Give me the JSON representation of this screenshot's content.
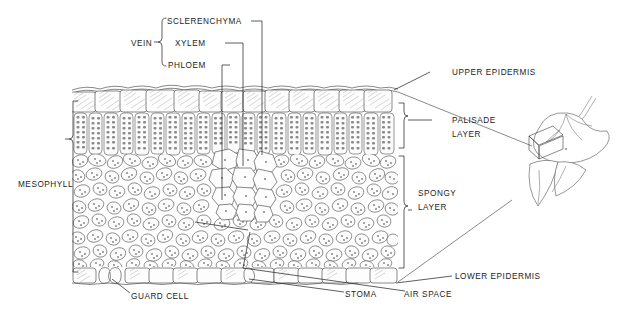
{
  "figure": {
    "background_color": "#ffffff",
    "ink_color": "#1c1c1c"
  },
  "labels": {
    "vein": "VEIN",
    "sclerenchyma": "SCLERENCHYMA",
    "xylem": "XYLEM",
    "phloem": "PHLOEM",
    "upper_epidermis": "UPPER  EPIDERMIS",
    "palisade_layer_line1": "PALISADE",
    "palisade_layer_line2": "LAYER",
    "spongy_layer_line1": "SPONGY",
    "spongy_layer_line2": "LAYER",
    "mesophyll": "MESOPHYLL",
    "lower_epidermis": "LOWER  EPIDERMIS",
    "guard_cell": "GUARD  CELL",
    "stoma": "STOMA",
    "air_space": "AIR  SPACE"
  },
  "structures": {
    "tissue_block": {
      "left": 72,
      "right": 398,
      "top": 86,
      "bottom": 282
    },
    "layers": [
      {
        "name": "cuticle",
        "top": 86,
        "bottom": 90
      },
      {
        "name": "upper-epidermis",
        "top": 90,
        "bottom": 112
      },
      {
        "name": "palisade-layer",
        "top": 112,
        "bottom": 155
      },
      {
        "name": "spongy-layer",
        "top": 155,
        "bottom": 265
      },
      {
        "name": "lower-epidermis",
        "top": 265,
        "bottom": 282
      }
    ],
    "vascular_bundle": {
      "center_x": 243,
      "top": 150,
      "bottom": 215
    }
  },
  "brackets": {
    "mesophyll": {
      "x": 74,
      "top": 101,
      "bottom": 272
    },
    "palisade": {
      "x": 404,
      "top": 103,
      "bottom": 152
    },
    "spongy": {
      "x": 404,
      "top": 156,
      "bottom": 268
    },
    "vein": {
      "x": 166,
      "top": 20,
      "bottom": 64
    }
  },
  "leaf_inset": {
    "name": "whole-leaf-illustration",
    "center_x": 556,
    "center_y": 158,
    "sample_box": {
      "x": 529,
      "y": 128,
      "w": 28,
      "h": 24
    }
  }
}
